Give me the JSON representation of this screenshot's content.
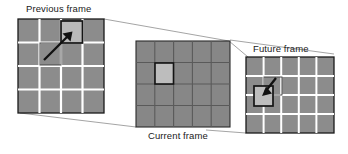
{
  "diagram": {
    "type": "frame-sequence-diagram",
    "labels": {
      "previous": "Previous frame",
      "current": "Current frame",
      "future": "Future frame"
    },
    "colors": {
      "cell_gray": "#8c8c8c",
      "cell_gray_dark": "#808080",
      "highlight_light": "#b9b9b9",
      "highlight_light_2": "#bdbdbd",
      "gridline_white": "#ffffff",
      "gridline_dark": "#5a5a5a",
      "outline_black": "#1a1a1a",
      "connector_gray": "#9a9a9a",
      "label_text": "#1a1a1a",
      "arrow_black": "#111111"
    },
    "panels": [
      {
        "id": "previous-frame",
        "label": "Previous frame",
        "grid_cols": 4,
        "grid_rows": 4,
        "gridline_style": "white",
        "highlight_cell": {
          "col": 2,
          "row": 1
        },
        "ghost_cell": {
          "col": 1,
          "row": 2
        },
        "arrow": {
          "direction": "up-right",
          "from": "ghost_cell",
          "to": "highlight_cell"
        }
      },
      {
        "id": "current-frame",
        "label": "Current frame",
        "grid_cols": 5,
        "grid_rows": 4,
        "gridline_style": "dark",
        "highlight_cell": {
          "col": 1,
          "row": 1
        },
        "ghost_cell": null,
        "arrow": null
      },
      {
        "id": "future-frame",
        "label": "Future frame",
        "grid_cols": 5,
        "grid_rows": 4,
        "gridline_style": "white",
        "highlight_cell": {
          "col": 0,
          "row": 1
        },
        "ghost_cell": {
          "col": 1,
          "row": 1
        },
        "arrow": {
          "direction": "down-left",
          "from": "ghost_cell",
          "to": "highlight_cell"
        }
      }
    ],
    "connectors": [
      {
        "id": "previous-to-current-top",
        "from": "previous-frame",
        "to": "current-frame"
      },
      {
        "id": "previous-to-current-bottom",
        "from": "previous-frame",
        "to": "current-frame"
      },
      {
        "id": "current-to-future-top",
        "from": "current-frame",
        "to": "future-frame"
      },
      {
        "id": "current-to-future-bottom",
        "from": "current-frame",
        "to": "future-frame"
      }
    ]
  }
}
